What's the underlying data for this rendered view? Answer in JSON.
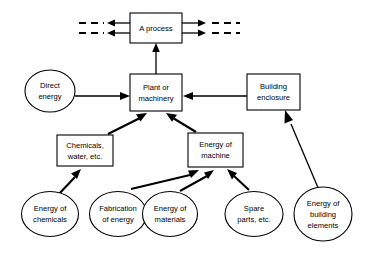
{
  "diagram": {
    "type": "flow-diagram",
    "background_color": "#ffffff",
    "stroke_color": "#000000",
    "nodes": [
      {
        "id": "a-process",
        "shape": "rectangle",
        "lines": [
          "A process"
        ],
        "cx": 156,
        "cy": 28,
        "w": 52,
        "h": 30
      },
      {
        "id": "plant-machinery",
        "shape": "rectangle",
        "lines": [
          "Plant or",
          "machinery"
        ],
        "cx": 156,
        "cy": 93,
        "w": 52,
        "h": 37
      },
      {
        "id": "building-enclosure",
        "shape": "rectangle",
        "lines": [
          "Building",
          "enclosure"
        ],
        "cx": 274,
        "cy": 92,
        "w": 53,
        "h": 36
      },
      {
        "id": "chemicals-water",
        "shape": "rectangle",
        "lines": [
          "Chemicals,",
          "water, etc."
        ],
        "cx": 85,
        "cy": 150,
        "w": 55,
        "h": 31
      },
      {
        "id": "energy-of-machine",
        "shape": "rectangle",
        "lines": [
          "Energy of",
          "machine"
        ],
        "cx": 215,
        "cy": 150,
        "w": 55,
        "h": 34
      },
      {
        "id": "direct-energy",
        "shape": "ellipse",
        "lines": [
          "Direct",
          "energy"
        ],
        "cx": 50,
        "cy": 91,
        "w": 50,
        "h": 42
      },
      {
        "id": "energy-of-chemicals",
        "shape": "ellipse",
        "lines": [
          "Energy of",
          "chemicals"
        ],
        "cx": 50,
        "cy": 214,
        "w": 57,
        "h": 45
      },
      {
        "id": "fabrication-of-energy",
        "shape": "ellipse",
        "lines": [
          "Fabrication",
          "of energy"
        ],
        "cx": 118,
        "cy": 214,
        "w": 57,
        "h": 45
      },
      {
        "id": "energy-of-materials",
        "shape": "ellipse",
        "lines": [
          "Energy of",
          "materials"
        ],
        "cx": 170,
        "cy": 214,
        "w": 55,
        "h": 45
      },
      {
        "id": "spare-parts",
        "shape": "ellipse",
        "lines": [
          "Spare",
          "parts, etc."
        ],
        "cx": 254,
        "cy": 214,
        "w": 58,
        "h": 45
      },
      {
        "id": "energy-of-building-elements",
        "shape": "ellipse",
        "lines": [
          "Energy of",
          "building",
          "elements"
        ],
        "cx": 323,
        "cy": 214,
        "w": 58,
        "h": 54
      }
    ],
    "edges": [
      {
        "id": "direct-energy-to-plant",
        "from": "direct-energy",
        "to": "plant-machinery",
        "style": "solid-thin"
      },
      {
        "id": "building-enclosure-to-plant",
        "from": "building-enclosure",
        "to": "plant-machinery",
        "style": "solid-thin"
      },
      {
        "id": "plant-to-process",
        "from": "plant-machinery",
        "to": "a-process",
        "style": "solid-thin"
      },
      {
        "id": "chemicals-to-plant",
        "from": "chemicals-water",
        "to": "plant-machinery",
        "style": "solid-thick"
      },
      {
        "id": "machine-energy-to-plant",
        "from": "energy-of-machine",
        "to": "plant-machinery",
        "style": "solid-thick"
      },
      {
        "id": "energy-chemicals-to-chemicals",
        "from": "energy-of-chemicals",
        "to": "chemicals-water",
        "style": "solid-thick"
      },
      {
        "id": "fabrication-to-machine",
        "from": "fabrication-of-energy",
        "to": "energy-of-machine",
        "style": "solid-thick"
      },
      {
        "id": "materials-to-machine",
        "from": "energy-of-materials",
        "to": "energy-of-machine",
        "style": "solid-thick"
      },
      {
        "id": "spare-parts-to-machine",
        "from": "spare-parts",
        "to": "energy-of-machine",
        "style": "solid-thick"
      },
      {
        "id": "building-elements-to-enclosure",
        "from": "energy-of-building-elements",
        "to": "building-enclosure",
        "style": "solid-thin"
      },
      {
        "id": "process-input-upper",
        "from": "external",
        "to": "a-process",
        "style": "dashed-in"
      },
      {
        "id": "process-input-lower",
        "from": "external",
        "to": "a-process",
        "style": "dashed-in"
      },
      {
        "id": "process-output-upper",
        "from": "a-process",
        "to": "external",
        "style": "dashed-out"
      },
      {
        "id": "process-output-lower",
        "from": "a-process",
        "to": "external",
        "style": "dashed-out"
      }
    ],
    "labels": {
      "a_process": "A process",
      "plant_or": "Plant or",
      "machinery": "machinery",
      "building": "Building",
      "enclosure": "enclosure",
      "chemicals": "Chemicals,",
      "water_etc": "water, etc.",
      "energy_of_1": "Energy of",
      "machine": "machine",
      "direct": "Direct",
      "energy": "energy",
      "energy_of_2": "Energy of",
      "chemicals_2": "chemicals",
      "fabrication": "Fabrication",
      "of_energy": "of energy",
      "energy_of_3": "Energy of",
      "materials": "materials",
      "spare": "Spare",
      "parts_etc": "parts, etc.",
      "energy_of_4": "Energy of",
      "building_2": "building",
      "elements": "elements"
    }
  }
}
